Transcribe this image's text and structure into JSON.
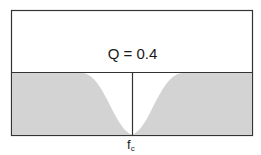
{
  "diagram": {
    "title_label": "Q = 0.4",
    "q_value": 0.4,
    "axis_marker": {
      "main": "f",
      "sub": "c"
    },
    "colors": {
      "fill": "#d3d3d3",
      "stroke": "#333333",
      "background": "#ffffff"
    }
  }
}
